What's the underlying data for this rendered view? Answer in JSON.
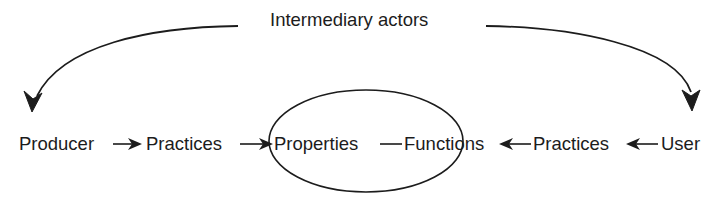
{
  "diagram": {
    "title": "Intermediary actors",
    "nodes": [
      {
        "id": "producer",
        "label": "Producer"
      },
      {
        "id": "practices_left",
        "label": "Practices"
      },
      {
        "id": "properties",
        "label": "Properties"
      },
      {
        "id": "functions",
        "label": "Functions"
      },
      {
        "id": "practices_right",
        "label": "Practices"
      },
      {
        "id": "user",
        "label": "User"
      }
    ],
    "edges": [
      {
        "from": "intermediary_actors",
        "to": "producer",
        "type": "curved-arrow"
      },
      {
        "from": "intermediary_actors",
        "to": "user",
        "type": "curved-arrow"
      },
      {
        "from": "producer",
        "to": "practices_left",
        "type": "arrow"
      },
      {
        "from": "practices_left",
        "to": "properties",
        "type": "arrow"
      },
      {
        "from": "properties",
        "to": "functions",
        "type": "line"
      },
      {
        "from": "practices_right",
        "to": "functions",
        "type": "arrow"
      },
      {
        "from": "user",
        "to": "practices_right",
        "type": "arrow"
      }
    ],
    "grouping": {
      "shape": "ellipse",
      "contains": [
        "properties",
        "functions"
      ]
    },
    "colors": {
      "stroke": "#1c1c1c",
      "background": "#ffffff"
    }
  }
}
